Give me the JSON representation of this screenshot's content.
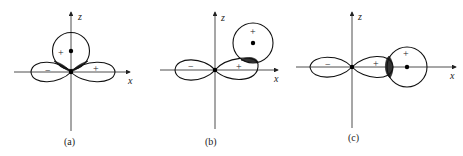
{
  "figure": {
    "axis_labels": {
      "x": "x",
      "z": "z"
    },
    "panels": [
      {
        "id": "a",
        "caption": "(a)",
        "s_orbital_sign": "+",
        "p_lobe_signs": {
          "negative": "−",
          "positive": "+"
        },
        "s_position": "on z-axis above origin",
        "overlap": "two shaded regions (cancel)"
      },
      {
        "id": "b",
        "caption": "(b)",
        "s_orbital_sign": "+",
        "p_lobe_signs": {
          "negative": "−",
          "positive": "+"
        },
        "s_position": "above positive x lobe",
        "overlap": "one shaded region"
      },
      {
        "id": "c",
        "caption": "(c)",
        "s_orbital_sign": "+",
        "p_lobe_signs": {
          "negative": "−",
          "positive": "+"
        },
        "s_position": "on x-axis beyond positive lobe",
        "overlap": "one shaded region (sigma)"
      }
    ]
  }
}
